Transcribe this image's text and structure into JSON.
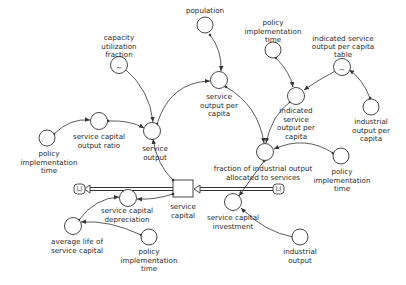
{
  "diagram": {
    "type": "stock-and-flow",
    "colors": {
      "stroke": "#333333",
      "text": "#2a2a2a",
      "background": "#ffffff"
    },
    "stocks": [
      {
        "id": "service_capital",
        "label_lines": [
          "service",
          "capital"
        ]
      }
    ],
    "flows": [
      {
        "id": "service_capital_investment",
        "label_lines": [
          "service capital",
          "investment"
        ],
        "from": "cloud-right",
        "to": "service_capital"
      },
      {
        "id": "service_capital_depreciation",
        "label_lines": [
          "service capital",
          "depreciation"
        ],
        "from": "service_capital",
        "to": "cloud-left"
      }
    ],
    "auxiliaries": [
      {
        "id": "capacity_utilization_fraction",
        "label_lines": [
          "capacity",
          "utilization",
          "fraction"
        ],
        "table": true
      },
      {
        "id": "population",
        "label_lines": [
          "population"
        ]
      },
      {
        "id": "policy_time_1",
        "label_lines": [
          "policy",
          "implementation",
          "time"
        ]
      },
      {
        "id": "ind_sopc_table",
        "label_lines": [
          "indicated service",
          "output per capita",
          "table"
        ],
        "table": true
      },
      {
        "id": "industrial_output_per_capita",
        "label_lines": [
          "industrial",
          "output per",
          "capita"
        ]
      },
      {
        "id": "service_output_per_capita",
        "label_lines": [
          "service",
          "output per",
          "capita"
        ]
      },
      {
        "id": "indicated_sopc",
        "label_lines": [
          "indicated",
          "service",
          "output per",
          "capita"
        ]
      },
      {
        "id": "service_capital_output_ratio",
        "label_lines": [
          "service capital",
          "output ratio"
        ]
      },
      {
        "id": "policy_time_2",
        "label_lines": [
          "policy",
          "implementation",
          "time"
        ]
      },
      {
        "id": "service_output",
        "label_lines": [
          "service",
          "output"
        ]
      },
      {
        "id": "fioas",
        "label_lines": [
          "fraction of industrial output",
          "allocated to services"
        ]
      },
      {
        "id": "policy_time_3",
        "label_lines": [
          "policy",
          "implementation",
          "time"
        ]
      },
      {
        "id": "average_life_service_capital",
        "label_lines": [
          "average life of",
          "service capital"
        ]
      },
      {
        "id": "policy_time_4",
        "label_lines": [
          "policy",
          "implementation",
          "time"
        ]
      },
      {
        "id": "industrial_output",
        "label_lines": [
          "industrial",
          "output"
        ]
      }
    ],
    "icons": [
      "cloud-source-icon",
      "cloud-sink-icon",
      "table-tilde-icon"
    ]
  }
}
